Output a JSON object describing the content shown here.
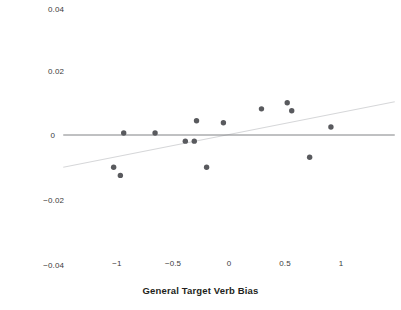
{
  "chart_data": {
    "type": "scatter",
    "title": "",
    "xlabel": "General Target Verb Bias",
    "ylabel": "Effect Size PD priming (probability)",
    "xlim": [
      -1.48,
      1.48
    ],
    "ylim": [
      -0.04,
      0.04
    ],
    "xticks": [
      -1,
      -0.5,
      0,
      0.5,
      1
    ],
    "xtick_labels": [
      "−1",
      "−0.5",
      "0",
      "0.5",
      "1"
    ],
    "yticks": [
      0.04,
      0.02,
      0,
      -0.02,
      -0.04
    ],
    "ytick_labels": [
      "0.04",
      "0.02",
      "0",
      "−0.02",
      "−0.04"
    ],
    "grid": false,
    "legend": null,
    "series": [
      {
        "name": "studies",
        "marker": "circle",
        "color": "#595a5e",
        "points": [
          {
            "x": -1.03,
            "y": -0.01
          },
          {
            "x": -0.97,
            "y": -0.0125
          },
          {
            "x": -0.94,
            "y": 0.0006
          },
          {
            "x": -0.66,
            "y": 0.0006
          },
          {
            "x": -0.39,
            "y": -0.0019
          },
          {
            "x": -0.31,
            "y": -0.0019
          },
          {
            "x": -0.29,
            "y": 0.0044
          },
          {
            "x": -0.2,
            "y": -0.01
          },
          {
            "x": -0.05,
            "y": 0.0038
          },
          {
            "x": 0.29,
            "y": 0.0081
          },
          {
            "x": 0.52,
            "y": 0.01
          },
          {
            "x": 0.56,
            "y": 0.0075
          },
          {
            "x": 0.72,
            "y": -0.0069
          },
          {
            "x": 0.91,
            "y": 0.0025
          }
        ]
      }
    ],
    "reference_line": {
      "name": "zero-line",
      "y": 0,
      "color": "#808285",
      "x_from": -1.48,
      "x_to": 1.48
    },
    "fit_line": {
      "name": "regression-line",
      "color": "#d6d7d9",
      "x_from": -1.48,
      "x_to": 1.48,
      "y_from": -0.01,
      "y_to": 0.0103
    }
  },
  "axes": {
    "x_title": "General Target Verb Bias",
    "y_title": "Effect Size PD priming (probability)"
  },
  "colors": {
    "marker": "#595a5e",
    "zero_line": "#808285",
    "fit_line": "#d6d7d9",
    "text": "#231f20",
    "tick_text": "#3b3b3d",
    "background": "#ffffff"
  }
}
